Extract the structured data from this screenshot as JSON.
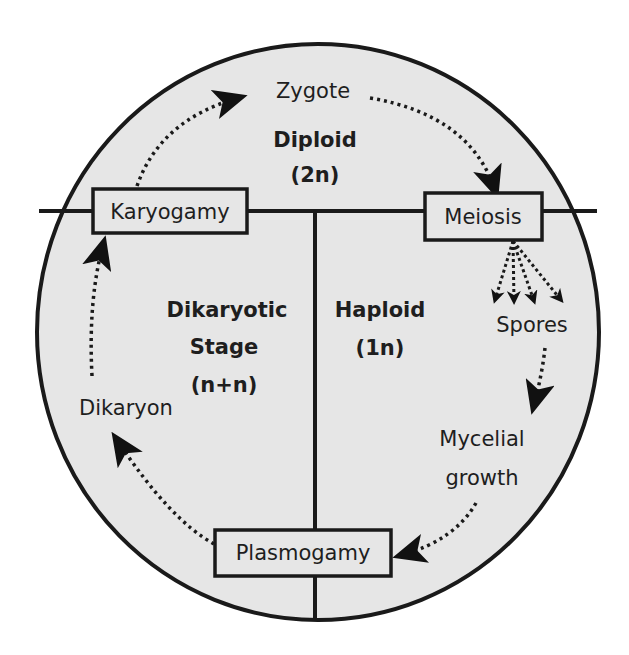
{
  "diagram": {
    "colors": {
      "background": "#ffffff",
      "circle_fill": "#e6e6e6",
      "stroke": "#1a1a1a",
      "text": "#1e1e1e"
    },
    "regions": {
      "diploid": {
        "name": "Diploid",
        "ploidy": "(2n)"
      },
      "dikaryotic": {
        "name_line1": "Dikaryotic",
        "name_line2": "Stage",
        "ploidy": "(n+n)"
      },
      "haploid": {
        "name": "Haploid",
        "ploidy": "(1n)"
      }
    },
    "boxes": {
      "karyogamy": "Karyogamy",
      "meiosis": "Meiosis",
      "plasmogamy": "Plasmogamy"
    },
    "labels": {
      "zygote": "Zygote",
      "spores": "Spores",
      "mycelial_line1": "Mycelial",
      "mycelial_line2": "growth",
      "dikaryon": "Dikaryon"
    },
    "flow": [
      "Karyogamy → Zygote",
      "Zygote → Meiosis",
      "Meiosis → Spores (4)",
      "Spores → Mycelial growth",
      "Mycelial growth → Plasmogamy",
      "Plasmogamy → Dikaryon",
      "Dikaryon → Karyogamy"
    ]
  }
}
